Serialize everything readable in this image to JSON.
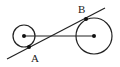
{
  "diagram": {
    "type": "geometry",
    "stroke_color": "#222222",
    "small_circle": {
      "cx": 24,
      "cy": 36,
      "r": 11
    },
    "large_circle": {
      "cx": 94,
      "cy": 36,
      "r": 18
    },
    "center_segment": {
      "x1": 24,
      "y1": 36,
      "x2": 94,
      "y2": 36
    },
    "tangent_line": {
      "x1": 7,
      "y1": 59,
      "x2": 105,
      "y2": 8
    },
    "points": [
      {
        "name": "A",
        "x": 29,
        "y": 47,
        "label_x": 31,
        "label_y": 62
      },
      {
        "name": "B",
        "x": 86,
        "y": 19,
        "label_x": 78,
        "label_y": 13
      }
    ],
    "labels": {
      "A": "A",
      "B": "B"
    }
  }
}
